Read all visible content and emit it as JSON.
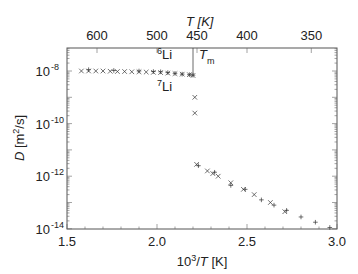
{
  "chart_data": {
    "type": "scatter",
    "title": "",
    "xlabel": "10^3/T [K]",
    "ylabel": "D [m^2/s]",
    "top_xlabel": "T [K]",
    "xlim": [
      1.5,
      3.0
    ],
    "ylim_log10": [
      -14,
      -7.1
    ],
    "yscale": "log",
    "x_ticks": [
      "1.5",
      "2.0",
      "2.5",
      "3.0"
    ],
    "x_tick_values": [
      1.5,
      2.0,
      2.5,
      3.0
    ],
    "y_ticks": [
      "10^-8",
      "10^-10",
      "10^-12",
      "10^-14"
    ],
    "y_tick_exponents": [
      -8,
      -10,
      -12,
      -14
    ],
    "top_ticks": [
      "600",
      "500",
      "450",
      "400",
      "350"
    ],
    "top_tick_values_K": [
      600,
      500,
      450,
      400,
      350
    ],
    "grid": false,
    "annotations": [
      {
        "text": "6Li",
        "sup": "6",
        "base": "Li",
        "x": 2.03,
        "log10y": -7.65
      },
      {
        "text": "7Li",
        "sup": "7",
        "base": "Li",
        "x": 2.03,
        "log10y": -8.65
      },
      {
        "text": "Tm",
        "base": "T",
        "sub": "m",
        "x": 2.27,
        "log10y": -7.7
      }
    ],
    "melting_line_x": 2.2,
    "series": [
      {
        "name": "6Li",
        "marker": "+",
        "x": [
          1.62,
          1.76,
          1.9,
          1.98,
          2.02,
          2.06,
          2.1,
          2.14,
          2.18,
          2.2,
          2.23,
          2.32,
          2.41,
          2.49,
          2.58,
          2.65,
          2.72,
          2.8,
          2.88,
          2.96
        ],
        "log10y": [
          -7.95,
          -7.98,
          -8.0,
          -8.02,
          -8.03,
          -8.06,
          -8.09,
          -8.12,
          -8.14,
          -8.16,
          -11.6,
          -11.85,
          -12.35,
          -12.5,
          -12.9,
          -13.1,
          -13.3,
          -13.55,
          -13.75,
          -13.95
        ]
      },
      {
        "name": "7Li",
        "marker": "x",
        "x": [
          1.58,
          1.62,
          1.66,
          1.7,
          1.74,
          1.78,
          1.82,
          1.86,
          1.9,
          1.94,
          1.98,
          2.02,
          2.06,
          2.1,
          2.14,
          2.18,
          2.2,
          2.21,
          2.21,
          2.22,
          2.28,
          2.31,
          2.34,
          2.41,
          2.48,
          2.54,
          2.63,
          2.71
        ],
        "log10y": [
          -8.0,
          -8.0,
          -8.0,
          -8.0,
          -8.01,
          -8.02,
          -8.02,
          -8.03,
          -8.03,
          -8.04,
          -8.05,
          -8.06,
          -8.08,
          -8.1,
          -8.12,
          -8.14,
          -8.17,
          -9.0,
          -9.6,
          -11.55,
          -11.8,
          -11.9,
          -12.0,
          -12.25,
          -12.5,
          -12.7,
          -13.0,
          -13.35
        ]
      }
    ]
  }
}
